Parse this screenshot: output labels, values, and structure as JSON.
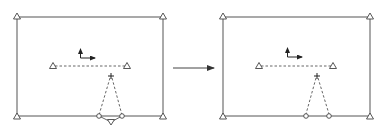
{
  "diagram": {
    "colors": {
      "stroke": "#555555",
      "background": "#ffffff"
    },
    "panels": [
      {
        "id": "before",
        "frame": {
          "x1": 17,
          "y1": 17,
          "x2": 163,
          "y2": 116
        },
        "corner_supports": [
          [
            17,
            17
          ],
          [
            163,
            17
          ],
          [
            17,
            116
          ],
          [
            163,
            116
          ]
        ],
        "axes_icon": {
          "origin": [
            80,
            58
          ],
          "up_len": 9,
          "right_len": 15
        },
        "dashed_beam": {
          "left": [
            53,
            66
          ],
          "right": [
            127,
            66
          ]
        },
        "plus_marker": [
          111,
          76
        ],
        "links": [
          [
            99,
            116
          ],
          [
            122,
            116
          ]
        ],
        "bottom_joint": [
          111,
          123
        ],
        "has_bottom_joint": true
      },
      {
        "id": "after",
        "frame": {
          "x1": 223,
          "y1": 17,
          "x2": 370,
          "y2": 116
        },
        "corner_supports": [
          [
            223,
            17
          ],
          [
            370,
            17
          ],
          [
            223,
            116
          ],
          [
            370,
            116
          ]
        ],
        "axes_icon": {
          "origin": [
            287,
            57
          ],
          "up_len": 9,
          "right_len": 15
        },
        "dashed_beam": {
          "left": [
            259,
            66
          ],
          "right": [
            333,
            66
          ]
        },
        "plus_marker": [
          317,
          76
        ],
        "links": [
          [
            306,
            116
          ],
          [
            329,
            116
          ]
        ],
        "has_bottom_joint": false
      }
    ],
    "transition_arrow": {
      "from": [
        173,
        68
      ],
      "to": [
        215,
        68
      ]
    }
  }
}
